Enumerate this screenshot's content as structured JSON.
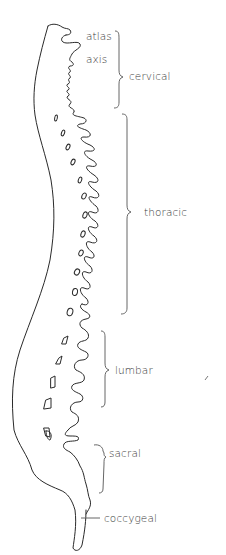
{
  "diagram": {
    "title": "",
    "line_color": "#2a2a2a",
    "bracket_color": "#555555",
    "labels": {
      "atlas": "atlas",
      "axis": "axis",
      "cervical": "cervical",
      "thoracic": "thoracic",
      "lumbar": "lumbar",
      "sacral": "sacral",
      "coccygeal": "coccygeal"
    },
    "regions": [
      {
        "name": "cervical",
        "bracket_top": 33,
        "bracket_bottom": 108,
        "label_y": 76
      },
      {
        "name": "thoracic",
        "bracket_top": 113,
        "bracket_bottom": 314,
        "label_y": 212
      },
      {
        "name": "lumbar",
        "bracket_top": 330,
        "bracket_bottom": 407,
        "label_y": 369
      },
      {
        "name": "sacral",
        "bracket_top": 435,
        "bracket_bottom": 493,
        "label_y": 453
      },
      {
        "name": "coccygeal",
        "pointer_y": 518
      }
    ]
  }
}
